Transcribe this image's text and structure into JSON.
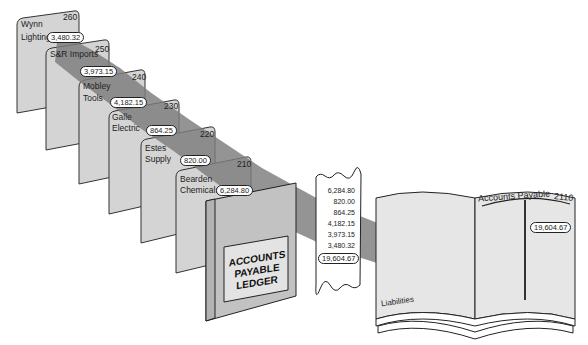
{
  "colors": {
    "card_fill": "#d4d4d4",
    "card_border": "#333333",
    "ribbon": "#8a8a8a",
    "ledger_fill": "#c6c6c6",
    "book_page": "#e6e6e6",
    "background": "#ffffff"
  },
  "cards": [
    {
      "name": "Wynn Lighting",
      "line1": "Wynn",
      "line2": "Lighting",
      "number": "260",
      "amount": "3,480.32"
    },
    {
      "name": "S&R Imports",
      "line1": "S&R Imports",
      "line2": "",
      "number": "250",
      "amount": "3,973.15"
    },
    {
      "name": "Mobley Tools",
      "line1": "Mobley",
      "line2": "Tools",
      "number": "240",
      "amount": "4,182.15"
    },
    {
      "name": "Galle Electric",
      "line1": "Galle",
      "line2": "Electric",
      "number": "230",
      "amount": "864.25"
    },
    {
      "name": "Estes Supply",
      "line1": "Estes",
      "line2": "Supply",
      "number": "220",
      "amount": "820.00"
    },
    {
      "name": "Bearden Chemicals",
      "line1": "Bearden",
      "line2": "Chemicals",
      "number": "210",
      "amount": "6,284.80"
    }
  ],
  "ledger": {
    "line1": "ACCOUNTS",
    "line2": "PAYABLE",
    "line3": "LEDGER"
  },
  "receipt": {
    "lines": [
      "6,284.80",
      "820.00",
      "864.25",
      "4,182.15",
      "3,973.15",
      "3,480.32"
    ],
    "total": "19,604.67"
  },
  "book": {
    "left_label": "Liabilities",
    "account_title": "Accounts Payable",
    "account_number": "2110",
    "balance": "19,604.67"
  }
}
